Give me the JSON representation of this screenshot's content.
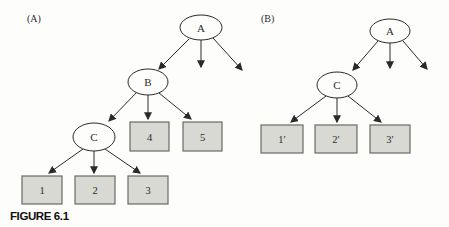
{
  "figure": {
    "caption": "FIGURE 6.1",
    "panel_a_label": "(A)",
    "panel_b_label": "(B)"
  },
  "tree_a": {
    "nodes": {
      "A": "A",
      "B": "B",
      "C": "C"
    },
    "leaves": {
      "l1": "1",
      "l2": "2",
      "l3": "3",
      "l4": "4",
      "l5": "5"
    },
    "structure": "A -> (B, unlabeled, unlabeled); B -> (C, 4, 5); C -> (1, 2, 3)"
  },
  "tree_b": {
    "nodes": {
      "A": "A",
      "C": "C"
    },
    "leaves": {
      "l1": "1′",
      "l2": "2′",
      "l3": "3′"
    },
    "structure": "A -> (C, unlabeled, unlabeled); C -> (1′, 2′, 3′)"
  },
  "colors": {
    "background": "#fdfdfc",
    "line": "#2a2a2a",
    "node_fill": "#fdfdfc",
    "box_fill": "#d9d9d3",
    "box_border": "#6a6a66",
    "text": "#2b2b2b"
  }
}
